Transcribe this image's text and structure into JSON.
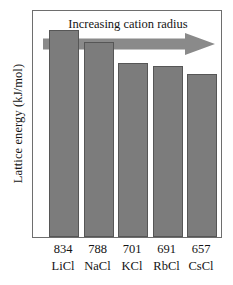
{
  "chart_data": {
    "type": "bar",
    "title": "",
    "subtitle": "",
    "xlabel": "",
    "ylabel": "Lattice energy (kJ/mol)",
    "categories": [
      "LiCl",
      "NaCl",
      "KCl",
      "RbCl",
      "CsCl"
    ],
    "values": [
      834,
      788,
      701,
      691,
      657
    ],
    "value_labels": [
      "834",
      "788",
      "701",
      "691",
      "657"
    ],
    "units": "kJ/mol",
    "ylim": [
      0,
      920
    ],
    "grid": false,
    "legend": null,
    "annotations": [
      {
        "name": "increasing-cation-radius",
        "text": "Increasing cation radius",
        "direction": "right",
        "shape": "arrow"
      }
    ],
    "bar_color": "#7c7c7c",
    "bar_edge_color": "#565656",
    "frame_color": "#6e6e6e",
    "arrow_color": "#8a8a8a"
  },
  "figure": {
    "ylabel": "Lattice energy (kJ/mol)",
    "annotation": "Increasing cation radius",
    "ticks": [
      {
        "value": "834",
        "name": "LiCl"
      },
      {
        "value": "788",
        "name": "NaCl"
      },
      {
        "value": "701",
        "name": "KCl"
      },
      {
        "value": "691",
        "name": "RbCl"
      },
      {
        "value": "657",
        "name": "CsCl"
      }
    ]
  }
}
